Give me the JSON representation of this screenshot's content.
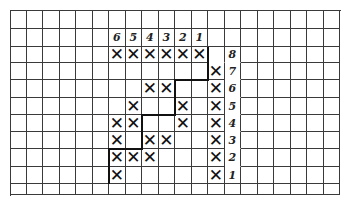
{
  "grid": {
    "cols": 20,
    "rows": 11,
    "col_width": 16.5,
    "row_heights": [
      19,
      18,
      16,
      17,
      18,
      17,
      17,
      17,
      18,
      17,
      11
    ],
    "line_color": "#3a3a3a",
    "path_color": "#111111"
  },
  "top_labels": [
    {
      "col": 6,
      "row": 1,
      "text": "6"
    },
    {
      "col": 7,
      "row": 1,
      "text": "5"
    },
    {
      "col": 8,
      "row": 1,
      "text": "4"
    },
    {
      "col": 9,
      "row": 1,
      "text": "3"
    },
    {
      "col": 10,
      "row": 1,
      "text": "2"
    },
    {
      "col": 11,
      "row": 1,
      "text": "1"
    }
  ],
  "side_labels": [
    {
      "col": 13,
      "row": 2,
      "text": "8"
    },
    {
      "col": 13,
      "row": 3,
      "text": "7"
    },
    {
      "col": 13,
      "row": 4,
      "text": "6"
    },
    {
      "col": 13,
      "row": 5,
      "text": "5"
    },
    {
      "col": 13,
      "row": 6,
      "text": "4"
    },
    {
      "col": 13,
      "row": 7,
      "text": "3"
    },
    {
      "col": 13,
      "row": 8,
      "text": "2"
    },
    {
      "col": 13,
      "row": 9,
      "text": "1"
    }
  ],
  "marks": {
    "symbol": "✕",
    "cells": [
      [
        6,
        2
      ],
      [
        7,
        2
      ],
      [
        8,
        2
      ],
      [
        9,
        2
      ],
      [
        10,
        2
      ],
      [
        11,
        2
      ],
      [
        12,
        3
      ],
      [
        8,
        4
      ],
      [
        9,
        4
      ],
      [
        12,
        4
      ],
      [
        7,
        5
      ],
      [
        10,
        5
      ],
      [
        12,
        5
      ],
      [
        6,
        6
      ],
      [
        7,
        6
      ],
      [
        10,
        6
      ],
      [
        12,
        6
      ],
      [
        6,
        7
      ],
      [
        8,
        7
      ],
      [
        9,
        7
      ],
      [
        12,
        7
      ],
      [
        6,
        8
      ],
      [
        7,
        8
      ],
      [
        8,
        8
      ],
      [
        12,
        8
      ],
      [
        6,
        9
      ],
      [
        12,
        9
      ]
    ]
  },
  "staircase_path": [
    [
      6,
      10
    ],
    [
      6,
      8
    ],
    [
      8,
      8
    ],
    [
      8,
      6
    ],
    [
      10,
      6
    ],
    [
      10,
      4
    ],
    [
      12,
      4
    ],
    [
      12,
      2
    ]
  ],
  "no_hline_cells": [
    [
      13,
      2
    ],
    [
      13,
      3
    ],
    [
      13,
      4
    ],
    [
      13,
      5
    ],
    [
      13,
      6
    ],
    [
      13,
      7
    ],
    [
      13,
      8
    ],
    [
      12,
      2
    ]
  ]
}
